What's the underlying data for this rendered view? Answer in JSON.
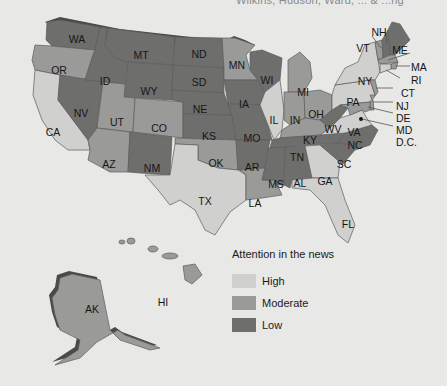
{
  "caption": "Wilkins, Hudson, Ward, ... & ...ng",
  "colors": {
    "high": "#d0d0cf",
    "moderate": "#9a9a99",
    "low": "#6e6e6d",
    "background": "#e8e8e6"
  },
  "legend": {
    "title": "Attention in the news",
    "items": [
      {
        "label": "High",
        "level": "high"
      },
      {
        "label": "Moderate",
        "level": "moderate"
      },
      {
        "label": "Low",
        "level": "low"
      }
    ]
  },
  "states": {
    "WA": "low",
    "OR": "moderate",
    "CA": "high",
    "NV": "low",
    "ID": "low",
    "MT": "low",
    "WY": "low",
    "UT": "moderate",
    "CO": "moderate",
    "AZ": "moderate",
    "NM": "low",
    "ND": "low",
    "SD": "low",
    "NE": "low",
    "KS": "low",
    "OK": "moderate",
    "TX": "high",
    "MN": "moderate",
    "IA": "low",
    "MO": "low",
    "AR": "low",
    "LA": "moderate",
    "WI": "low",
    "IL": "high",
    "MI": "moderate",
    "IN": "moderate",
    "OH": "moderate",
    "KY": "moderate",
    "TN": "low",
    "MS": "low",
    "AL": "low",
    "GA": "high",
    "FL": "high",
    "SC": "low",
    "NC": "low",
    "VA": "high",
    "WV": "low",
    "PA": "high",
    "NY": "high",
    "VT": "moderate",
    "NH": "low",
    "ME": "low",
    "MA": "moderate",
    "RI": "moderate",
    "CT": "high",
    "NJ": "moderate",
    "DE": "moderate",
    "MD": "moderate",
    "DC": "low",
    "AK": "moderate",
    "HI": "moderate"
  },
  "labels": {
    "WA": "WA",
    "OR": "OR",
    "CA": "CA",
    "NV": "NV",
    "ID": "ID",
    "MT": "MT",
    "WY": "WY",
    "UT": "UT",
    "CO": "CO",
    "AZ": "AZ",
    "NM": "NM",
    "ND": "ND",
    "SD": "SD",
    "NE": "NE",
    "KS": "KS",
    "OK": "OK",
    "TX": "TX",
    "MN": "MN",
    "IA": "IA",
    "MO": "MO",
    "AR": "AR",
    "LA": "LA",
    "WI": "WI",
    "IL": "IL",
    "MI": "MI",
    "IN": "IN",
    "OH": "OH",
    "KY": "KY",
    "TN": "TN",
    "MS": "MS",
    "AL": "AL",
    "GA": "GA",
    "FL": "FL",
    "SC": "SC",
    "NC": "NC",
    "VA": "VA",
    "WV": "WV",
    "PA": "PA",
    "NY": "NY",
    "VT": "VT",
    "NH": "NH",
    "ME": "ME",
    "MA": "MA",
    "RI": "RI",
    "CT": "CT",
    "NJ": "NJ",
    "DE": "DE",
    "MD": "MD",
    "DC": "D.C.",
    "AK": "AK",
    "HI": "HI"
  }
}
